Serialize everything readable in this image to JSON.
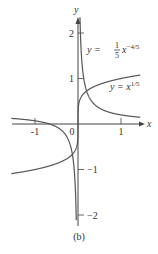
{
  "chart_data": {
    "type": "line",
    "title": "",
    "caption": "(b)",
    "xlabel": "x",
    "ylabel": "y",
    "xlim": [
      -1.8,
      1.5
    ],
    "ylim": [
      -2.2,
      2.4
    ],
    "x_ticks": [
      -1,
      0,
      1
    ],
    "x_tick_labels": [
      "-1",
      "0",
      "1"
    ],
    "y_ticks": [
      -2,
      -1,
      1,
      2
    ],
    "y_tick_labels": [
      "−2",
      "−1",
      "1",
      "2"
    ],
    "grid": false,
    "series": [
      {
        "name": "y = x^(1/5)",
        "label_main": "y = x",
        "label_sup": "1/5",
        "formula": "x^(1/5)"
      },
      {
        "name": "y = (1/5) x^(-4/5)",
        "label_main": "y = ",
        "label_frac_num": "1",
        "label_frac_den": "5",
        "label_x": "x",
        "label_sup": "−4/5",
        "formula": "(1/5)*x^(-4/5)"
      }
    ],
    "colors": {
      "curve": "#555555",
      "axis": "#444444",
      "text": "#333333"
    }
  }
}
